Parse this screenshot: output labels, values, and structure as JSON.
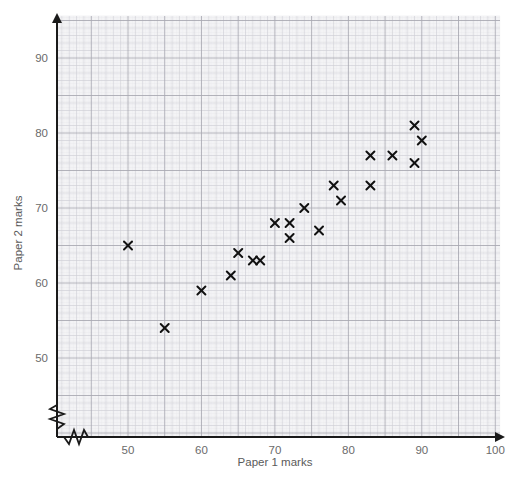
{
  "chart_data": {
    "type": "scatter",
    "title": "",
    "xlabel": "Paper 1 marks",
    "ylabel": "Paper 2 marks",
    "xlim": [
      44,
      100
    ],
    "ylim": [
      47,
      95
    ],
    "xticks": [
      50,
      60,
      70,
      80,
      90,
      100
    ],
    "yticks": [
      50,
      60,
      70,
      80,
      90
    ],
    "xtick_labels": [
      "50",
      "60",
      "70",
      "80",
      "90",
      "100"
    ],
    "ytick_labels": [
      "50",
      "60",
      "70",
      "80",
      "90"
    ],
    "grid": true,
    "grid_minor": true,
    "legend": "none",
    "marker": "x",
    "marker_color": "#111111",
    "axis_break_x": true,
    "axis_break_y": true,
    "points": [
      {
        "x": 50,
        "y": 65
      },
      {
        "x": 55,
        "y": 54
      },
      {
        "x": 60,
        "y": 59
      },
      {
        "x": 64,
        "y": 61
      },
      {
        "x": 65,
        "y": 64
      },
      {
        "x": 67,
        "y": 63
      },
      {
        "x": 68,
        "y": 63
      },
      {
        "x": 70,
        "y": 68
      },
      {
        "x": 72,
        "y": 68
      },
      {
        "x": 72,
        "y": 66
      },
      {
        "x": 74,
        "y": 70
      },
      {
        "x": 76,
        "y": 67
      },
      {
        "x": 78,
        "y": 73
      },
      {
        "x": 79,
        "y": 71
      },
      {
        "x": 83,
        "y": 77
      },
      {
        "x": 83,
        "y": 73
      },
      {
        "x": 86,
        "y": 77
      },
      {
        "x": 89,
        "y": 81
      },
      {
        "x": 89,
        "y": 76
      },
      {
        "x": 90,
        "y": 79
      }
    ]
  },
  "colors": {
    "axis": "#1a1a1a",
    "grid_minor": "#e6e6ea",
    "grid_major": "#cfcfd6",
    "grid_bold": "#a9a9b2",
    "tick_text": "#6b6b6b",
    "marker": "#111111",
    "background": "#ffffff"
  },
  "geometry": {
    "plot_left": 57,
    "plot_right": 500,
    "plot_top": 16,
    "plot_bottom": 437,
    "x_origin_px": 128,
    "x_origin_val": 50,
    "x_scale_px_per_unit": 7.345,
    "y_origin_px": 358,
    "y_origin_val": 50,
    "y_scale_px_per_unit": 7.5
  }
}
